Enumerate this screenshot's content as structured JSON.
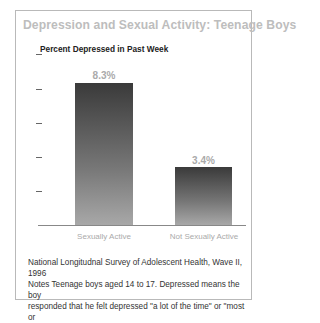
{
  "chart_data": {
    "type": "bar",
    "title": "Depression and Sexual Activity: Teenage Boys",
    "ylabel": "Percent Depressed in Past Week",
    "xlabel": "",
    "categories": [
      "Sexually Active",
      "Not Sexually Active"
    ],
    "values": [
      8.3,
      3.4
    ],
    "value_labels": [
      "8.3%",
      "3.4%"
    ],
    "ylim": [
      0,
      10
    ],
    "yticks": [
      0,
      2,
      4,
      6,
      8,
      10
    ],
    "grid": false,
    "legend": null
  },
  "note": {
    "line1": "National Longitudnal Survey of Adolescent Health, Wave II, 1996",
    "line2": "Notes Teenage boys aged 14 to 17. Depressed means the boy",
    "line3": "responded that he felt depressed \"a lot of the time\" or \"most or"
  }
}
